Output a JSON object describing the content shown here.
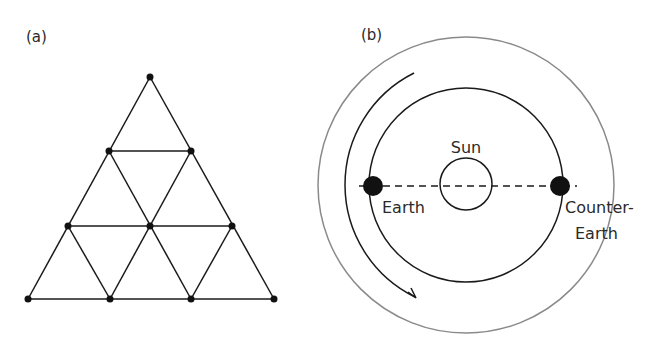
{
  "panel_a": {
    "label": "(a)",
    "description": "Triangular lattice of 10 nodes forming 9 small equilateral triangles",
    "nodes": [
      [
        150,
        77
      ],
      [
        109,
        151
      ],
      [
        191,
        151
      ],
      [
        68,
        226
      ],
      [
        150,
        226
      ],
      [
        232,
        226
      ],
      [
        28,
        299
      ],
      [
        110,
        299
      ],
      [
        191,
        299
      ],
      [
        274,
        299
      ]
    ]
  },
  "panel_b": {
    "label": "(b)",
    "sun_label": "Sun",
    "earth_label": "Earth",
    "counter_earth_label_line1": "Counter-",
    "counter_earth_label_line2": "Earth",
    "colors": {
      "outer_orbit": "#8a8a8a",
      "inner_orbit": "#1a1a1a",
      "planet": "#111111"
    }
  }
}
